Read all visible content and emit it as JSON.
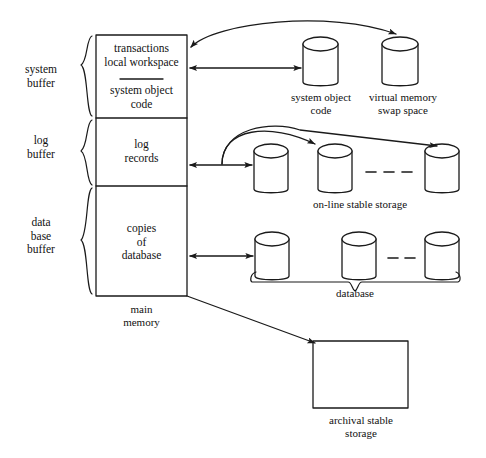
{
  "diagram": {
    "stroke_color": "#1a1a1a",
    "background": "#ffffff",
    "left_labels": [
      {
        "name": "system-buffer",
        "line1": "system",
        "line2": "buffer"
      },
      {
        "name": "log-buffer",
        "line1": "log",
        "line2": "buffer"
      },
      {
        "name": "data-base-buffer",
        "line1": "data",
        "line2": "base",
        "line3": "buffer"
      }
    ],
    "main_memory": {
      "caption_line1": "main",
      "caption_line2": "memory",
      "sections": [
        {
          "name": "system-buffer-section",
          "line1": "transactions",
          "line2": "local  workspace",
          "line3": "system object",
          "line4": "code",
          "has_divider": true
        },
        {
          "name": "log-buffer-section",
          "line1": "log",
          "line2": "records"
        },
        {
          "name": "database-buffer-section",
          "line1": "copies",
          "line2": "of",
          "line3": "database"
        }
      ]
    },
    "disks": {
      "system_object_code": {
        "line1": "system object",
        "line2": "code"
      },
      "virtual_memory_swap": {
        "line1": "virtual memory",
        "line2": "swap space"
      },
      "online_stable_storage": {
        "label": "on-line stable storage",
        "count": 3,
        "ellipsis": "- - - -"
      },
      "database": {
        "label": "database",
        "count": 3,
        "ellipsis": "- - - -"
      }
    },
    "archival": {
      "line1": "archival stable",
      "line2": "storage"
    }
  }
}
